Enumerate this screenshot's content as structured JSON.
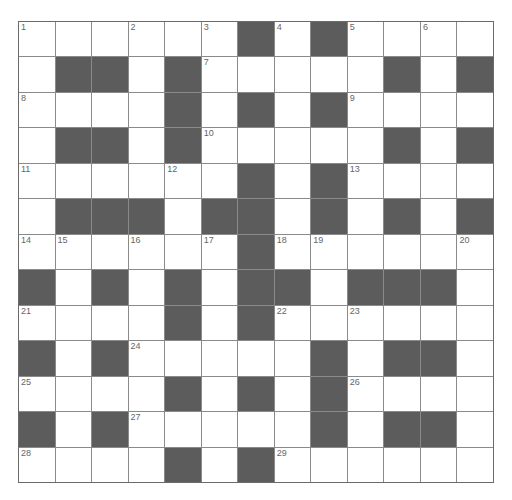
{
  "puzzle": {
    "rows": 13,
    "cols": 13,
    "colors": {
      "black_cell": "#5c5c5c",
      "white_cell": "#ffffff",
      "grid_line": "#8a8a8a",
      "number_text": "#666666"
    },
    "layout": [
      "......#.#....",
      ".##.#.....#.#",
      "....#.#.#....",
      ".##.#.....#.#",
      "......#.#....",
      ".###.##.#.#.#",
      "......#......",
      "#.#.#.##.###.",
      "....#.#......",
      "#.#.....#.##.",
      "....#.#.#....",
      "#.#.....#.##.",
      "....#.#......"
    ],
    "numbers": [
      {
        "row": 0,
        "col": 0,
        "n": "1"
      },
      {
        "row": 0,
        "col": 3,
        "n": "2"
      },
      {
        "row": 0,
        "col": 5,
        "n": "3"
      },
      {
        "row": 0,
        "col": 7,
        "n": "4"
      },
      {
        "row": 0,
        "col": 9,
        "n": "5"
      },
      {
        "row": 0,
        "col": 11,
        "n": "6"
      },
      {
        "row": 1,
        "col": 5,
        "n": "7"
      },
      {
        "row": 2,
        "col": 0,
        "n": "8"
      },
      {
        "row": 2,
        "col": 9,
        "n": "9"
      },
      {
        "row": 3,
        "col": 5,
        "n": "10"
      },
      {
        "row": 4,
        "col": 0,
        "n": "11"
      },
      {
        "row": 4,
        "col": 4,
        "n": "12"
      },
      {
        "row": 4,
        "col": 9,
        "n": "13"
      },
      {
        "row": 6,
        "col": 0,
        "n": "14"
      },
      {
        "row": 6,
        "col": 1,
        "n": "15"
      },
      {
        "row": 6,
        "col": 3,
        "n": "16"
      },
      {
        "row": 6,
        "col": 5,
        "n": "17"
      },
      {
        "row": 6,
        "col": 7,
        "n": "18"
      },
      {
        "row": 6,
        "col": 8,
        "n": "19"
      },
      {
        "row": 6,
        "col": 12,
        "n": "20"
      },
      {
        "row": 8,
        "col": 0,
        "n": "21"
      },
      {
        "row": 8,
        "col": 7,
        "n": "22"
      },
      {
        "row": 8,
        "col": 9,
        "n": "23"
      },
      {
        "row": 9,
        "col": 3,
        "n": "24"
      },
      {
        "row": 10,
        "col": 0,
        "n": "25"
      },
      {
        "row": 10,
        "col": 9,
        "n": "26"
      },
      {
        "row": 11,
        "col": 3,
        "n": "27"
      },
      {
        "row": 12,
        "col": 0,
        "n": "28"
      },
      {
        "row": 12,
        "col": 7,
        "n": "29"
      }
    ]
  }
}
